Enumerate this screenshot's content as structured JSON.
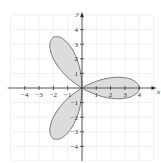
{
  "chart_data": {
    "type": "line",
    "title": "",
    "subtitle": "",
    "equation_hint": "three-petal rose r = 4cos(3θ)",
    "xlabel": "x",
    "ylabel": "y",
    "xlim": [
      -4.8,
      4.8
    ],
    "ylim": [
      -4.8,
      4.8
    ],
    "grid": true,
    "legend": null,
    "x_ticks": [
      -4,
      -3,
      -2,
      -1,
      1,
      2,
      3,
      4
    ],
    "y_ticks": [
      -4,
      -3,
      -2,
      -1,
      1,
      2,
      3,
      4
    ],
    "x_tick_labels": [
      "−4",
      "−3",
      "−2",
      "−1",
      "1",
      "2",
      "3",
      "4"
    ],
    "y_tick_labels": [
      "−4",
      "−3",
      "−2",
      "−1",
      "1",
      "2",
      "3",
      "4"
    ],
    "series": [
      {
        "name": "rose curve",
        "polar": {
          "a": 4,
          "k": 3,
          "func": "cos"
        },
        "petal_tips": [
          [
            4,
            0
          ],
          [
            -2,
            3.46
          ],
          [
            -2,
            -3.46
          ]
        ],
        "fill": "#dcdcdc",
        "stroke": "#666666"
      }
    ]
  },
  "colors": {
    "grid": "#e6e6e6",
    "axis": "#333333",
    "fill": "#dcdcdc",
    "stroke": "#6a6a6a"
  }
}
